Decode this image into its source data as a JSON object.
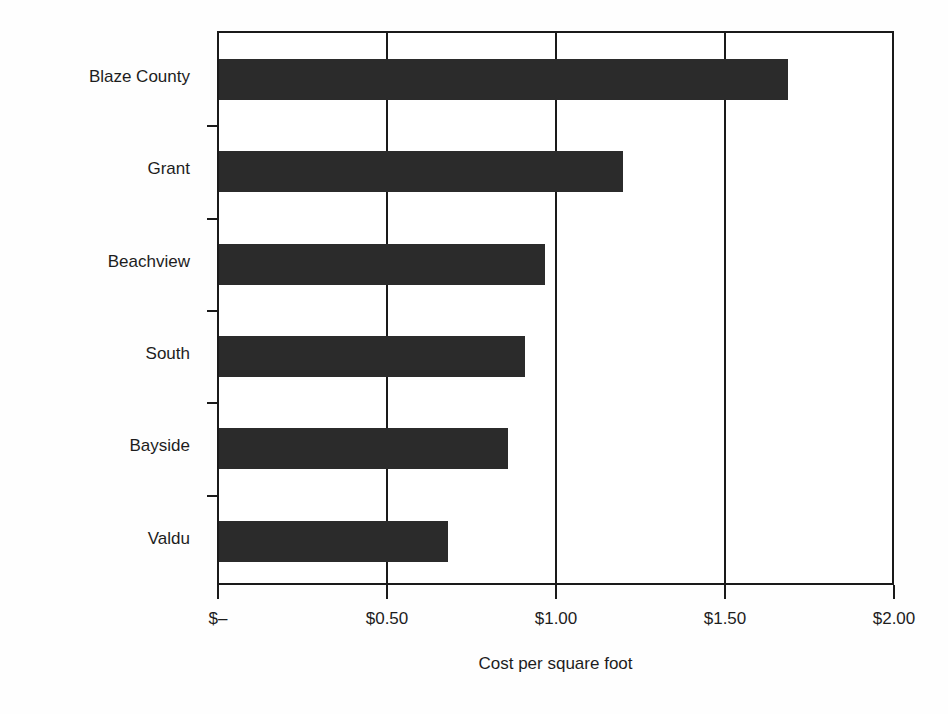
{
  "chart_data": {
    "type": "bar",
    "orientation": "horizontal",
    "title": "",
    "subtitle": "",
    "xlabel": "Cost per square foot",
    "ylabel": "",
    "categories": [
      "Blaze County",
      "Grant",
      "Beachview",
      "South",
      "Bayside",
      "Valdu"
    ],
    "values": [
      1.69,
      1.2,
      0.97,
      0.91,
      0.86,
      0.68
    ],
    "series": [
      {
        "name": "Cost per square foot",
        "values": [
          1.69,
          1.2,
          0.97,
          0.91,
          0.86,
          0.68
        ]
      }
    ],
    "xlim": [
      0,
      2.0
    ],
    "xticks": [
      0,
      0.5,
      1.0,
      1.5,
      2.0
    ],
    "xtick_labels": [
      "$–",
      "$0.50",
      "$1.00",
      "$1.50",
      "$2.00"
    ],
    "grid": true,
    "grid_axis": "x",
    "legend": false,
    "legend_position": "none",
    "bar_color": "#2b2b2b",
    "axis_color": "#1a1a1a",
    "background_color": "#ffffff"
  },
  "axis": {
    "x_title": "Cost per square foot"
  }
}
